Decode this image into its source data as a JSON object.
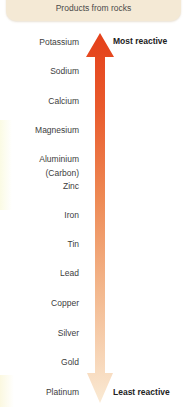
{
  "banner": {
    "title": "Products from rocks",
    "color": "#f4e9d5"
  },
  "scale": {
    "top_label": "Most reactive",
    "bottom_label": "Least reactive",
    "arrow_top_color": "#e8461e",
    "arrow_bottom_color": "#f8e2c4"
  },
  "metals": [
    {
      "name": "Potassium",
      "y": 42
    },
    {
      "name": "Sodium",
      "y": 71
    },
    {
      "name": "Calcium",
      "y": 101
    },
    {
      "name": "Magnesium",
      "y": 130
    },
    {
      "name": "Aluminium",
      "y": 159
    },
    {
      "name": "(Carbon)",
      "y": 173
    },
    {
      "name": "Zinc",
      "y": 186
    },
    {
      "name": "Iron",
      "y": 215
    },
    {
      "name": "Tin",
      "y": 244
    },
    {
      "name": "Lead",
      "y": 273
    },
    {
      "name": "Copper",
      "y": 303
    },
    {
      "name": "Silver",
      "y": 333
    },
    {
      "name": "Gold",
      "y": 362
    },
    {
      "name": "Platinum",
      "y": 392
    }
  ]
}
